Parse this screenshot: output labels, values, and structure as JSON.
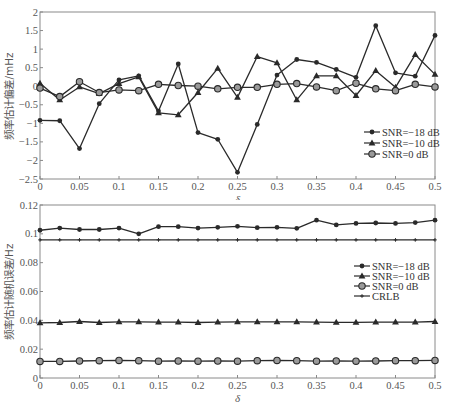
{
  "chart_data": [
    {
      "type": "line",
      "title": "",
      "xlabel": "δ",
      "ylabel": "频率估计偏差/mHz",
      "xlim": [
        0,
        0.5
      ],
      "ylim": [
        -2.5,
        2
      ],
      "xticks": [
        0,
        0.05,
        0.1,
        0.15,
        0.2,
        0.25,
        0.3,
        0.35,
        0.4,
        0.45,
        0.5
      ],
      "xtick_labels": [
        "0",
        "0.05",
        "0.1",
        "0.15",
        "0.2",
        "0.25",
        "0.3",
        "0.35",
        "0.4",
        "0.45",
        "0.5"
      ],
      "yticks": [
        -2.5,
        -2,
        -1.5,
        -1,
        -0.5,
        0,
        0.5,
        1,
        1.5,
        2
      ],
      "ytick_labels": [
        "-2.5",
        "-2",
        "-1.5",
        "-1",
        "-0.5",
        "0",
        "0.5",
        "1",
        "1.5",
        "2"
      ],
      "grid": false,
      "legend_position": "lower right",
      "x": [
        0,
        0.025,
        0.05,
        0.075,
        0.1,
        0.125,
        0.15,
        0.175,
        0.2,
        0.225,
        0.25,
        0.275,
        0.3,
        0.325,
        0.35,
        0.375,
        0.4,
        0.425,
        0.45,
        0.475,
        0.5
      ],
      "series": [
        {
          "name": "SNR=−18 dB",
          "marker": "dot",
          "values": [
            -0.92,
            -0.93,
            -1.68,
            -0.47,
            0.17,
            0.28,
            -0.67,
            0.6,
            -1.25,
            -1.43,
            -2.32,
            -1.03,
            0.3,
            0.72,
            0.64,
            0.45,
            0.24,
            1.63,
            0.36,
            0.27,
            1.37
          ]
        },
        {
          "name": "SNR=−10 dB",
          "marker": "triangle",
          "values": [
            0.08,
            -0.37,
            -0.02,
            -0.2,
            0.07,
            0.25,
            -0.72,
            -0.77,
            -0.17,
            0.48,
            -0.3,
            0.8,
            0.63,
            -0.37,
            0.28,
            0.28,
            -0.25,
            0.42,
            -0.03,
            0.85,
            0.32
          ]
        },
        {
          "name": "SNR=0 dB",
          "marker": "circle",
          "values": [
            -0.05,
            -0.28,
            0.12,
            -0.17,
            -0.1,
            -0.12,
            0.05,
            0.02,
            0.0,
            -0.07,
            -0.03,
            -0.03,
            0.05,
            0.07,
            -0.02,
            -0.12,
            0.08,
            -0.07,
            -0.12,
            0.05,
            -0.02
          ]
        }
      ]
    },
    {
      "type": "line",
      "title": "",
      "xlabel": "δ",
      "ylabel": "频率估计随机误差/Hz",
      "xlim": [
        0,
        0.5
      ],
      "ylim": [
        0,
        0.12
      ],
      "xticks": [
        0,
        0.05,
        0.1,
        0.15,
        0.2,
        0.25,
        0.3,
        0.35,
        0.4,
        0.45,
        0.5
      ],
      "xtick_labels": [
        "0",
        "0.05",
        "0.1",
        "0.15",
        "0.2",
        "0.25",
        "0.3",
        "0.35",
        "0.4",
        "0.45",
        "0.5"
      ],
      "yticks": [
        0,
        0.02,
        0.04,
        0.06,
        0.08,
        0.1,
        0.12
      ],
      "ytick_labels": [
        "0",
        "0.02",
        "0.04",
        "0.06",
        "0.08",
        "0.1",
        "0.12"
      ],
      "grid": false,
      "legend_position": "center right",
      "x": [
        0,
        0.025,
        0.05,
        0.075,
        0.1,
        0.125,
        0.15,
        0.175,
        0.2,
        0.225,
        0.25,
        0.275,
        0.3,
        0.325,
        0.35,
        0.375,
        0.4,
        0.425,
        0.45,
        0.475,
        0.5
      ],
      "series": [
        {
          "name": "SNR=−18 dB",
          "marker": "dot",
          "values": [
            0.1025,
            0.104,
            0.103,
            0.103,
            0.104,
            0.1,
            0.105,
            0.105,
            0.104,
            0.1045,
            0.1052,
            0.1043,
            0.1045,
            0.1038,
            0.1095,
            0.1062,
            0.1072,
            0.1075,
            0.1072,
            0.1078,
            0.1095
          ]
        },
        {
          "name": "SNR=−10 dB",
          "marker": "triangle",
          "values": [
            0.0382,
            0.0385,
            0.0392,
            0.0385,
            0.039,
            0.039,
            0.0388,
            0.0388,
            0.0385,
            0.0388,
            0.039,
            0.039,
            0.039,
            0.039,
            0.0388,
            0.0386,
            0.0386,
            0.0388,
            0.0388,
            0.0388,
            0.0392
          ]
        },
        {
          "name": "SNR=0 dB",
          "marker": "circle",
          "values": [
            0.0115,
            0.0115,
            0.0118,
            0.012,
            0.0122,
            0.012,
            0.0117,
            0.0118,
            0.0117,
            0.0118,
            0.0117,
            0.012,
            0.0122,
            0.012,
            0.0117,
            0.0118,
            0.0117,
            0.0118,
            0.012,
            0.012,
            0.0122
          ]
        },
        {
          "name": "CRLB",
          "marker": "plus",
          "values": [
            0.0958,
            0.0958,
            0.0958,
            0.0958,
            0.0958,
            0.0958,
            0.0958,
            0.0958,
            0.0958,
            0.0958,
            0.0958,
            0.0958,
            0.0958,
            0.0958,
            0.0958,
            0.0958,
            0.0958,
            0.0958,
            0.0958,
            0.0958,
            0.0958
          ]
        }
      ]
    }
  ],
  "colors": {
    "line": "#2a2a2a",
    "axis": "#8a8a8a",
    "tick_text": "#555555"
  }
}
